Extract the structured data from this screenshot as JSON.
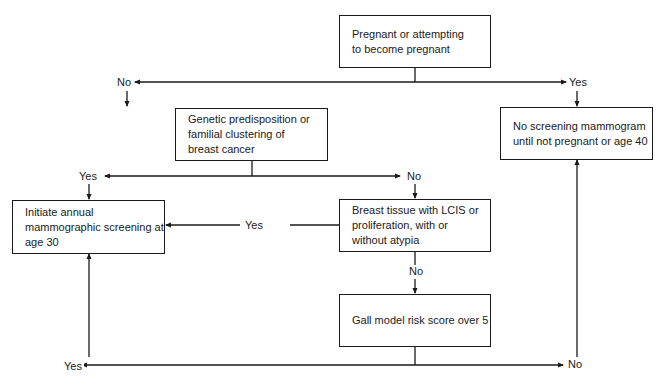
{
  "diagram": {
    "type": "flowchart",
    "nodes": {
      "pregnant": "Pregnant or attempting to become pregnant",
      "genetic": "Genetic predisposition or familial clustering of breast cancer",
      "initiate": "Initiate annual mammographic screening at age 30",
      "tissue": "Breast tissue with LCIS or proliferation, with or without atypia",
      "gall": "Gall model risk score over 5",
      "no_screening": "No screening mammogram until not pregnant or age 40"
    },
    "labels": {
      "pregnant_no": "No",
      "pregnant_yes": "Yes",
      "genetic_yes": "Yes",
      "genetic_no": "No",
      "tissue_yes": "Yes",
      "tissue_no": "No",
      "gall_yes": "Yes",
      "gall_no": "No"
    },
    "edges": [
      {
        "from": "pregnant",
        "to": "genetic",
        "label": "No"
      },
      {
        "from": "pregnant",
        "to": "no_screening",
        "label": "Yes"
      },
      {
        "from": "genetic",
        "to": "initiate",
        "label": "Yes"
      },
      {
        "from": "genetic",
        "to": "tissue",
        "label": "No"
      },
      {
        "from": "tissue",
        "to": "initiate",
        "label": "Yes"
      },
      {
        "from": "tissue",
        "to": "gall",
        "label": "No"
      },
      {
        "from": "gall",
        "to": "initiate",
        "label": "Yes"
      },
      {
        "from": "gall",
        "to": "no_screening",
        "label": "No"
      }
    ],
    "colors": {
      "line": "#1a1a1a",
      "background": "#ffffff"
    }
  }
}
